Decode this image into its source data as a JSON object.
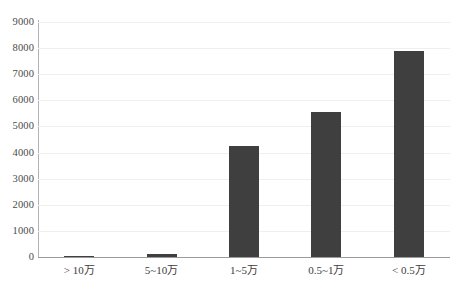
{
  "chart_data": {
    "type": "bar",
    "title": "",
    "subtitle": "",
    "xlabel": "",
    "ylabel": "",
    "categories": [
      "> 10万",
      "5~10万",
      "1~5万",
      "0.5~1万",
      "< 0.5万"
    ],
    "values": [
      30,
      130,
      4250,
      5550,
      7900
    ],
    "ylim": [
      0,
      9000
    ],
    "y_ticks": [
      0,
      1000,
      2000,
      3000,
      4000,
      5000,
      6000,
      7000,
      8000,
      9000
    ],
    "y_tick_labels": [
      "0",
      "1000",
      "2000",
      "3000",
      "4000",
      "5000",
      "6000",
      "7000",
      "8000",
      "9000"
    ],
    "grid": true,
    "grid_axis": "y",
    "legend": false,
    "legend_position": "none",
    "annotations": [],
    "colors": {
      "bar": "#3f3f3f",
      "gridline": "#efefef",
      "axis": "#b2b2b2",
      "baseline": "#9a9a9a",
      "background": "#ffffff",
      "tick_label": "#4a4a4a"
    }
  }
}
